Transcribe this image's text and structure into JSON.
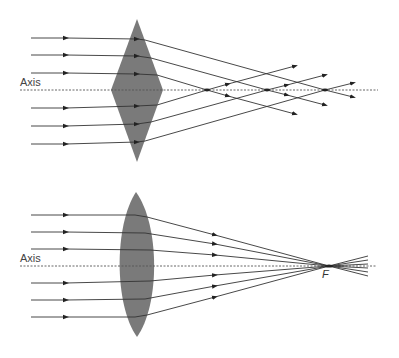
{
  "diagram": {
    "top": {
      "description": "Diamond (prism) lens: parallel rays do not converge to a single focus",
      "axis_label": "Axis",
      "lens_shape": "diamond",
      "focal_points_count": 3
    },
    "bottom": {
      "description": "Convex lens: parallel rays converge at focal point F",
      "axis_label": "Axis",
      "lens_shape": "biconvex",
      "focal_label": "F"
    },
    "colors": {
      "lens": "#7a7a7a",
      "ray": "#333333",
      "axis": "#555555"
    }
  }
}
